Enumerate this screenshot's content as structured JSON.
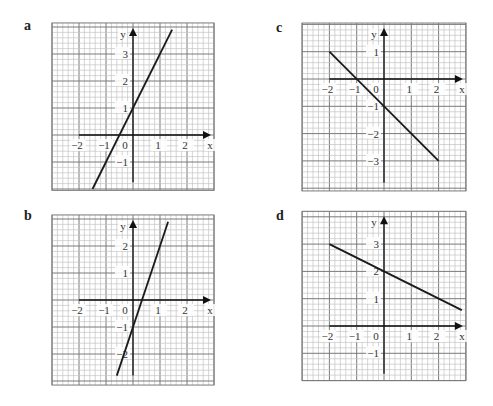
{
  "colors": {
    "minor_grid": "#c4c4c4",
    "major_grid": "#7a7a7a",
    "axis": "#111111",
    "line": "#1a1a1a",
    "label": "#222222"
  },
  "chart_data": [
    {
      "type": "line",
      "panel": "a",
      "title": "a",
      "xlabel": "x",
      "ylabel": "y",
      "equation": "y = 2x + 1",
      "x": [
        -1.5,
        1.45
      ],
      "y": [
        -2,
        3.9
      ],
      "x_ticks": [
        "-2",
        "-1",
        "0",
        "1",
        "2"
      ],
      "y_ticks": [
        "3",
        "2",
        "1",
        "-1"
      ],
      "xlim": [
        -3,
        3
      ],
      "ylim": [
        -2.05,
        4.15
      ],
      "grid": true,
      "layout": {
        "left": 52,
        "top": 22,
        "origin_x": 133,
        "origin_y": 135,
        "unit": 27,
        "axis_x_from": -2,
        "axis_y_from": -1.75
      },
      "tick_positions": {
        "x": [
          -2,
          -1,
          1,
          2
        ],
        "y": [
          3,
          2,
          1,
          -1
        ]
      }
    },
    {
      "type": "line",
      "panel": "b",
      "title": "b",
      "xlabel": "x",
      "ylabel": "y",
      "equation": "y = 3x - 1",
      "x": [
        -0.6,
        1.3
      ],
      "y": [
        -2.8,
        2.9
      ],
      "x_ticks": [
        "-2",
        "-1",
        "0",
        "1",
        "2"
      ],
      "y_ticks": [
        "2",
        "1",
        "-1",
        "-2"
      ],
      "xlim": [
        -3,
        3
      ],
      "ylim": [
        -3.15,
        3.15
      ],
      "grid": true,
      "layout": {
        "left": 52,
        "top": 215,
        "origin_x": 133,
        "origin_y": 300,
        "unit": 27,
        "axis_x_from": -2,
        "axis_y_from": -2.8
      },
      "tick_positions": {
        "x": [
          -2,
          -1,
          1,
          2
        ],
        "y": [
          2,
          1,
          -1,
          -2
        ]
      }
    },
    {
      "type": "line",
      "panel": "c",
      "title": "c",
      "xlabel": "x",
      "ylabel": "y",
      "equation": "y = -x - 1",
      "x": [
        -2,
        2
      ],
      "y": [
        1,
        -3
      ],
      "x_ticks": [
        "-2",
        "-1",
        "0",
        "1",
        "2"
      ],
      "y_ticks": [
        "1",
        "-1",
        "-2",
        "-3"
      ],
      "xlim": [
        -3,
        3
      ],
      "ylim": [
        -4.1,
        2.05
      ],
      "grid": true,
      "layout": {
        "left": 302,
        "top": 23,
        "origin_x": 384,
        "origin_y": 79,
        "unit": 27.3,
        "axis_x_from": -2,
        "axis_y_from": -3.8
      },
      "tick_positions": {
        "x": [
          -2,
          -1,
          1,
          2
        ],
        "y": [
          1,
          -1,
          -2,
          -3
        ]
      }
    },
    {
      "type": "line",
      "panel": "d",
      "title": "d",
      "xlabel": "x",
      "ylabel": "y",
      "equation": "y = -0.5x + 2",
      "x": [
        -2,
        2.85
      ],
      "y": [
        3,
        0.58
      ],
      "x_ticks": [
        "-2",
        "-1",
        "0",
        "1",
        "2"
      ],
      "y_ticks": [
        "3",
        "2",
        "1",
        "-1"
      ],
      "xlim": [
        -3,
        3
      ],
      "ylim": [
        -2,
        4.2
      ],
      "grid": true,
      "layout": {
        "left": 302,
        "top": 213,
        "origin_x": 384,
        "origin_y": 326,
        "unit": 27.3,
        "axis_x_from": -2,
        "axis_y_from": -1.75
      },
      "tick_positions": {
        "x": [
          -2,
          -1,
          1,
          2
        ],
        "y": [
          3,
          2,
          1,
          -1
        ]
      }
    }
  ],
  "panels": [
    {
      "label": "a",
      "label_x": 24,
      "label_y": 18
    },
    {
      "label": "b",
      "label_x": 24,
      "label_y": 208
    },
    {
      "label": "c",
      "label_x": 276,
      "label_y": 20
    },
    {
      "label": "d",
      "label_x": 276,
      "label_y": 208
    }
  ]
}
